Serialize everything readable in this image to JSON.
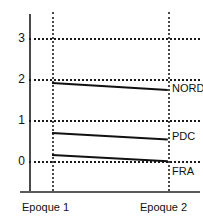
{
  "chart_data": {
    "type": "line",
    "title": "",
    "xlabel": "",
    "ylabel": "",
    "categories": [
      "Epoque 1",
      "Epoque 2"
    ],
    "x": [
      1,
      2
    ],
    "xlim": [
      0.72,
      2.08
    ],
    "ylim": [
      -1.0,
      3.55
    ],
    "grid": true,
    "gridlines": [
      0,
      1,
      2,
      3
    ],
    "ytick_labels": [
      "3",
      "2",
      "1",
      "0"
    ],
    "ytick_values": [
      3,
      2,
      1,
      0
    ],
    "legend_position": "right-inline",
    "series": [
      {
        "name": "NORD",
        "values": [
          1.92,
          1.75
        ]
      },
      {
        "name": "PDC",
        "values": [
          0.7,
          0.54
        ]
      },
      {
        "name": "FRA",
        "values": [
          0.17,
          0.02
        ]
      }
    ]
  },
  "labels": {
    "series": [
      "NORD",
      "PDC",
      "FRA"
    ],
    "yticks": [
      "3",
      "2",
      "1",
      "0"
    ],
    "xticks": [
      "Epoque 1",
      "Epoque 2"
    ]
  },
  "colors": {
    "line": "#111111",
    "grid": "#1a1a1a",
    "axis": "#4a4a4a",
    "background": "#ffffff"
  }
}
